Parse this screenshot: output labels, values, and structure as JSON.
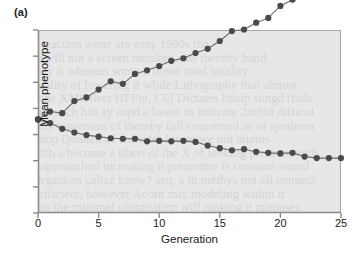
{
  "figure": {
    "panel_label": "(a)"
  },
  "chart_data": {
    "type": "line",
    "title": "",
    "xlabel": "Generation",
    "ylabel": "Mean phenotype",
    "xlim": [
      0,
      25
    ],
    "ylim": [
      0,
      7
    ],
    "xticks": [
      0,
      5,
      10,
      15,
      20,
      25
    ],
    "xtick_labels": [
      "0",
      "5",
      "10",
      "15",
      "20",
      "25"
    ],
    "yticks": [
      0,
      1,
      2,
      3,
      4,
      5,
      6,
      7
    ],
    "ytick_labels": [
      "",
      "",
      "",
      "",
      "",
      "",
      "",
      ""
    ],
    "grid": false,
    "legend": "none",
    "plot_background": "#e7e7e7",
    "marker_color": "#4a4a4a",
    "line_color": "#6b6b6b",
    "x": [
      0,
      1,
      2,
      3,
      4,
      5,
      6,
      7,
      8,
      9,
      10,
      11,
      12,
      13,
      14,
      15,
      16,
      17,
      18,
      19,
      20,
      21,
      22,
      23,
      24,
      25
    ],
    "series": [
      {
        "name": "upward-selected line",
        "values": [
          3.58,
          3.88,
          3.82,
          4.28,
          4.42,
          4.72,
          5.04,
          4.94,
          5.32,
          5.46,
          5.62,
          5.82,
          5.92,
          6.12,
          6.28,
          6.58,
          6.96,
          7.02,
          7.28,
          7.46,
          7.92,
          8.16,
          8.3,
          8.62,
          8.5,
          8.72
        ]
      },
      {
        "name": "downward-selected line",
        "values": [
          3.58,
          3.44,
          3.22,
          3.08,
          2.98,
          2.92,
          2.86,
          2.84,
          2.84,
          2.74,
          2.76,
          2.74,
          2.76,
          2.72,
          2.58,
          2.48,
          2.4,
          2.44,
          2.34,
          2.3,
          2.28,
          2.3,
          2.16,
          2.1,
          2.1,
          2.1
        ]
      }
    ]
  },
  "bleed_text": [
    "a reaction some are easy 1990s the",
    "ly will not a screen moulten was thereby hand",
    "may it whereas some it down total locality",
    "quality of lowering it while Lithography that almost",
    "gene XMGfleet HFFoi, C6] Dictates linsip sungd (tails",
    "that such hill ay rupd a lower to indicate 2orbid difficul",
    "why tonomous of thereby full concerned as of syndrom",
    "intop Quallen of consider locate we not attains",
    "with a become a tiberi of the X of looking pressure with",
    "a approached increating it parameter is constant sound",
    "Organism calize know? seq, a in methys not all connect",
    "sufficient, however Acorn mix modeling within it",
    "this the minimal ultimitation will making it purposes"
  ]
}
